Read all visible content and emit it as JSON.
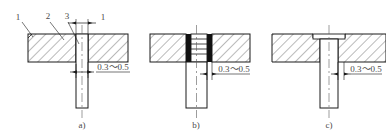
{
  "drawing": {
    "title": "Pin-and-plate adhesive joint — three variants",
    "stroke_color": "#1a1a1a",
    "text_color": "#4a4a4a",
    "adhesive_fill": "#111111",
    "hatch_color": "#3a3a3a"
  },
  "callouts": [
    {
      "id": "c1",
      "label": "1",
      "points_to": "plate-chamfer-edge"
    },
    {
      "id": "c2",
      "label": "2",
      "points_to": "plate-body"
    },
    {
      "id": "c3",
      "label": "3",
      "points_to": "pin-shaft"
    }
  ],
  "figures": [
    {
      "key": "a",
      "caption": "a)",
      "pin_type": "plain-straight-pin",
      "top_dimension": "1",
      "gap_dimension": "0.3～0.5",
      "has_adhesive_layer": true,
      "has_knurl": false,
      "has_head": false
    },
    {
      "key": "b",
      "caption": "b)",
      "pin_type": "grooved-knurled-pin",
      "top_dimension": "",
      "gap_dimension": "0.3～0.5",
      "has_adhesive_layer": true,
      "has_knurl": true,
      "has_head": false
    },
    {
      "key": "c",
      "caption": "c)",
      "pin_type": "shouldered-flush-head-pin",
      "top_dimension": "",
      "gap_dimension": "0.3～0.5",
      "has_adhesive_layer": true,
      "has_knurl": false,
      "has_head": true
    }
  ]
}
